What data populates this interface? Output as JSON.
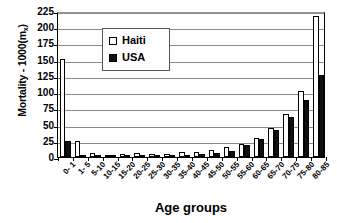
{
  "chart_data": {
    "type": "bar",
    "title": "",
    "xlabel": "Age groups",
    "ylabel": "Mortality - 1000(m",
    "ylabel_subscript": "x",
    "ylabel_suffix": ")",
    "ylim": [
      0,
      225
    ],
    "ytick_step": 25,
    "yticks": [
      225,
      200,
      175,
      150,
      125,
      100,
      75,
      50,
      25,
      0
    ],
    "grid": true,
    "legend_position": "upper-left-inside",
    "categories": [
      "0- 1",
      "1- 5",
      "5-10",
      "10-15",
      "15-20",
      "20-25",
      "25-30",
      "30-35",
      "35-40",
      "40-45",
      "45-50",
      "50-55",
      "55-60",
      "60-65",
      "65-70",
      "70-75",
      "75-80",
      "80-85"
    ],
    "series": [
      {
        "name": "Haiti",
        "color": "#ffffff",
        "values": [
          151,
          24,
          6,
          3,
          4,
          6,
          5,
          5,
          7,
          7,
          11,
          15,
          20,
          30,
          44,
          66,
          101,
          218
        ]
      },
      {
        "name": "USA",
        "color": "#101010",
        "values": [
          24,
          1,
          1,
          2,
          3,
          2,
          2,
          2,
          3,
          4,
          6,
          10,
          19,
          27,
          42,
          61,
          88,
          126
        ]
      }
    ]
  },
  "legend": {
    "entries": [
      {
        "label": "Haiti",
        "swatch": "open-square-icon"
      },
      {
        "label": "USA",
        "swatch": "filled-square-icon"
      }
    ]
  }
}
